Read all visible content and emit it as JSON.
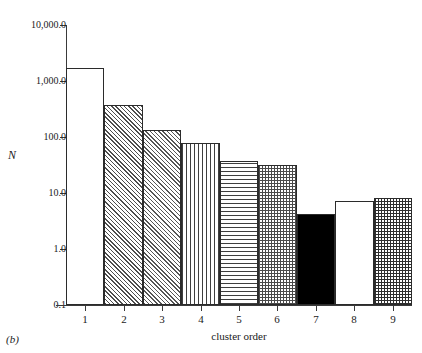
{
  "panel_label": "(b)",
  "chart_data": {
    "type": "bar",
    "title": "",
    "xlabel": "cluster order",
    "ylabel": "N",
    "yscale": "log",
    "ylim": [
      0.1,
      10000.0
    ],
    "grid": false,
    "legend": null,
    "categories": [
      "1",
      "2",
      "3",
      "4",
      "5",
      "6",
      "7",
      "8",
      "9"
    ],
    "values": [
      1700,
      370,
      135,
      78,
      37,
      31,
      4.2,
      7.3,
      8.2
    ],
    "ytick_labels": [
      "10,000.0",
      "1,000.0",
      "100.0",
      "10.0",
      "1.0",
      "0.1"
    ],
    "ytick_values": [
      10000.0,
      1000.0,
      100.0,
      10.0,
      1.0,
      0.1
    ],
    "xtick_labels": [
      "1",
      "2",
      "3",
      "4",
      "5",
      "6",
      "7",
      "8",
      "9"
    ],
    "bar_fills": [
      "empty",
      "diagonal",
      "diagonal-2",
      "vertical",
      "horizontal",
      "checker",
      "solid",
      "empty",
      "checker-dense"
    ],
    "colors": {
      "axis": "#3a3a3a",
      "bar_edge": "#2b2b2b",
      "bar_solid": "#000000",
      "bar_background": "#ffffff",
      "text": "#1a1a1a"
    }
  }
}
